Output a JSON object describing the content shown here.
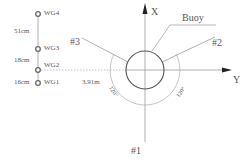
{
  "gauges": [
    {
      "id": "WG4",
      "label": "WG4"
    },
    {
      "id": "WG3",
      "label": "WG3"
    },
    {
      "id": "WG2",
      "label": "WG2"
    },
    {
      "id": "WG1",
      "label": "WG1"
    }
  ],
  "spacings": [
    {
      "label": "51cm"
    },
    {
      "label": "18cm"
    },
    {
      "label": "16cm"
    }
  ],
  "distance_label": "3.91m",
  "axes": {
    "x": "X",
    "y": "Y"
  },
  "buoy_label": "Buoy",
  "mooring_lines": [
    {
      "label": "#1"
    },
    {
      "label": "#2"
    },
    {
      "label": "#3"
    }
  ],
  "angles": [
    {
      "label": "120°"
    },
    {
      "label": "120°"
    }
  ],
  "colors": {
    "line": "#8a8a8a",
    "circle": "#555555",
    "text": "#555555"
  }
}
